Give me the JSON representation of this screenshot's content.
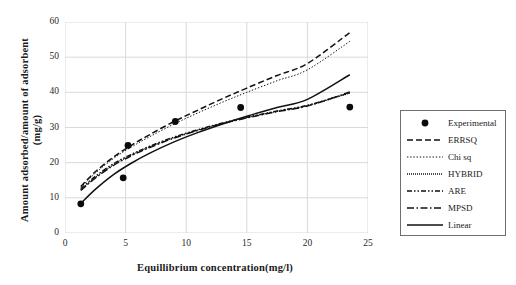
{
  "chart_data": {
    "type": "line",
    "title": "",
    "xlabel": "Equillibrium concentration(mg/l)",
    "ylabel": "Amount adsorbed/amount of adsorbent (mg/g)",
    "ylabel_line1": "Amount adsorbed/amount of adsorbent",
    "ylabel_line2": "(mg/g)",
    "xlim": [
      0,
      25
    ],
    "ylim": [
      0,
      60
    ],
    "xticks": [
      0,
      5,
      10,
      15,
      20,
      25
    ],
    "yticks": [
      0,
      10,
      20,
      30,
      40,
      50,
      60
    ],
    "grid": true,
    "legend_position": "right-outside",
    "scatter": {
      "name": "Experimental",
      "marker": "filled-circle",
      "points": [
        {
          "x": 1.3,
          "y": 8.3
        },
        {
          "x": 4.8,
          "y": 15.7
        },
        {
          "x": 5.2,
          "y": 24.9
        },
        {
          "x": 9.1,
          "y": 31.7
        },
        {
          "x": 14.5,
          "y": 35.7
        },
        {
          "x": 23.5,
          "y": 35.8
        }
      ]
    },
    "series": [
      {
        "name": "ERRSQ",
        "style": "dashed",
        "x": [
          1.3,
          2.5,
          4.0,
          5.5,
          7.0,
          9.0,
          11.0,
          13.0,
          15.0,
          17.5,
          20.0,
          23.5
        ],
        "y": [
          13.2,
          17.4,
          21.6,
          25.0,
          28.0,
          31.7,
          35.0,
          38.2,
          41.2,
          44.8,
          48.2,
          57.0
        ]
      },
      {
        "name": "Chi sq",
        "style": "dotted",
        "x": [
          1.3,
          2.5,
          4.0,
          5.5,
          7.0,
          9.0,
          11.0,
          13.0,
          15.0,
          17.5,
          20.0,
          23.5
        ],
        "y": [
          13.0,
          17.0,
          21.2,
          24.5,
          27.4,
          31.0,
          34.2,
          37.2,
          40.0,
          43.3,
          46.4,
          54.5
        ]
      },
      {
        "name": "HYBRID",
        "style": "fine-dotted",
        "x": [
          1.3,
          2.5,
          4.0,
          5.5,
          7.0,
          9.0,
          11.0,
          13.0,
          15.0,
          17.5,
          20.0,
          23.5
        ],
        "y": [
          12.3,
          15.8,
          19.4,
          22.2,
          24.5,
          27.1,
          29.3,
          31.2,
          32.8,
          34.6,
          36.2,
          39.8
        ]
      },
      {
        "name": "ARE",
        "style": "dash-dot-dot",
        "x": [
          1.3,
          2.5,
          4.0,
          5.5,
          7.0,
          9.0,
          11.0,
          13.0,
          15.0,
          17.5,
          20.0,
          23.5
        ],
        "y": [
          12.6,
          16.1,
          19.7,
          22.4,
          24.7,
          27.3,
          29.4,
          31.3,
          32.9,
          34.7,
          36.3,
          39.9
        ]
      },
      {
        "name": "MPSD",
        "style": "dash-dot",
        "x": [
          1.3,
          2.5,
          4.0,
          5.5,
          7.0,
          9.0,
          11.0,
          13.0,
          15.0,
          17.5,
          20.0,
          23.5
        ],
        "y": [
          12.1,
          15.6,
          19.2,
          22.0,
          24.3,
          27.0,
          29.2,
          31.1,
          32.7,
          34.5,
          36.1,
          40.1
        ]
      },
      {
        "name": "Linear",
        "style": "solid",
        "x": [
          1.3,
          2.5,
          4.0,
          5.5,
          7.0,
          9.0,
          11.0,
          13.0,
          15.0,
          17.5,
          20.0,
          23.5
        ],
        "y": [
          8.4,
          12.4,
          16.6,
          19.9,
          22.7,
          25.9,
          28.6,
          31.0,
          33.2,
          35.7,
          38.0,
          45.0
        ]
      }
    ]
  },
  "legend": {
    "items": [
      {
        "label": "Experimental",
        "key": "marker"
      },
      {
        "label": "ERRSQ",
        "key": "dashed"
      },
      {
        "label": "Chi sq",
        "key": "dotted"
      },
      {
        "label": "HYBRID",
        "key": "fine-dotted"
      },
      {
        "label": "ARE",
        "key": "dash-dot-dot"
      },
      {
        "label": "MPSD",
        "key": "dash-dot"
      },
      {
        "label": "Linear",
        "key": "solid"
      }
    ]
  },
  "colors": {
    "line": "#111111",
    "grid": "#d9d9d9",
    "text": "#1a1a1a",
    "legend_border": "#6f6f6f"
  }
}
